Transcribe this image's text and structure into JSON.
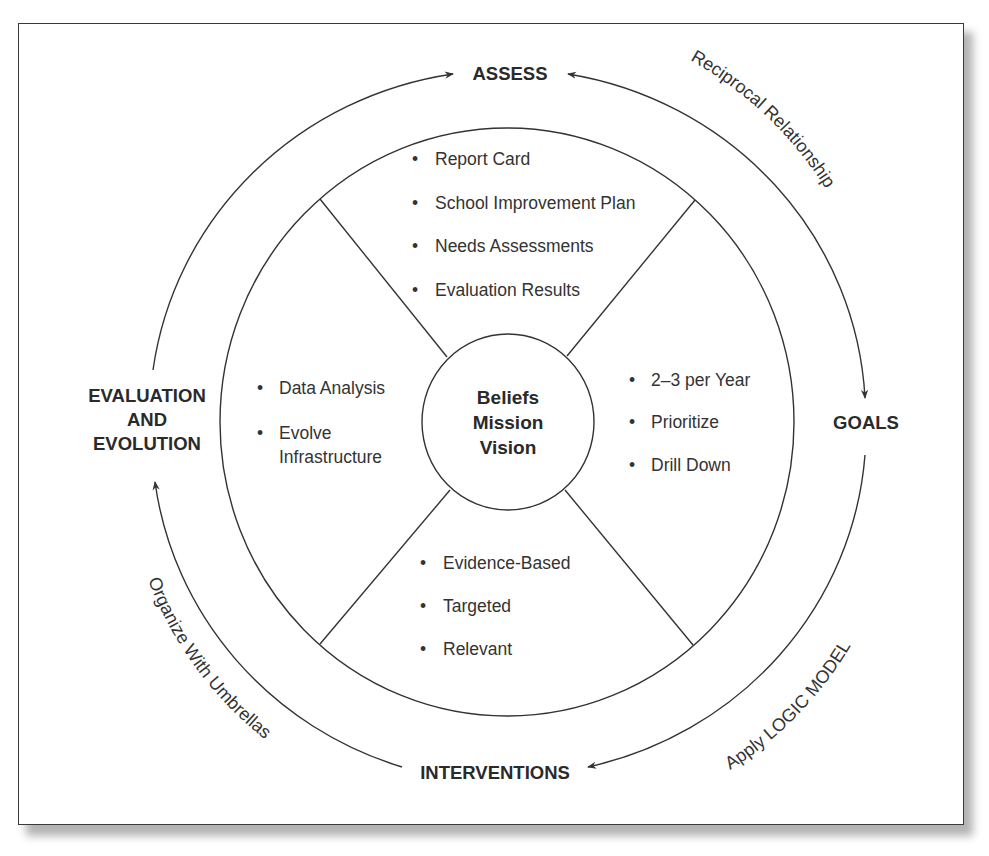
{
  "diagram": {
    "center": {
      "lines": [
        "Beliefs",
        "Mission",
        "Vision"
      ]
    },
    "stages": {
      "top": "ASSESS",
      "right": "GOALS",
      "bottom": "INTERVENTIONS",
      "left": [
        "EVALUATION",
        "AND",
        "EVOLUTION"
      ]
    },
    "arc_labels": {
      "top_right": "Reciprocal Relationship",
      "bottom_right": "Apply LOGIC MODEL",
      "bottom_left": "Organize With Umbrellas"
    },
    "quadrants": {
      "top": {
        "items": [
          "Report Card",
          "School Improvement Plan",
          "Needs Assessments",
          "Evaluation Results"
        ]
      },
      "right": {
        "items": [
          "2–3 per Year",
          "Prioritize",
          "Drill Down"
        ]
      },
      "bottom": {
        "items": [
          "Evidence-Based",
          "Targeted",
          "Relevant"
        ]
      },
      "left": {
        "items": [
          {
            "lines": [
              "Data Analysis"
            ]
          },
          {
            "lines": [
              "Evolve",
              "Infrastructure"
            ]
          }
        ]
      }
    },
    "bullet_glyph": "•",
    "colors": {
      "ink": "#2a2a2a",
      "frame_border": "#3a3a3a",
      "shadow": "#9a9a9a",
      "background": "#ffffff"
    }
  }
}
